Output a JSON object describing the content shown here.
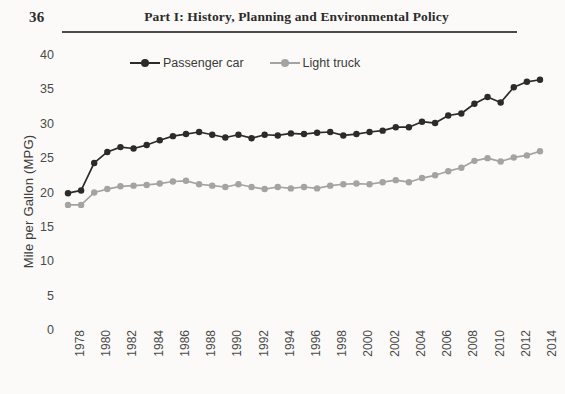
{
  "page": {
    "number": "36",
    "running_head": "Part I: History, Planning and Environmental Policy"
  },
  "chart_data": {
    "type": "line",
    "title": "",
    "xlabel": "",
    "ylabel": "Mile per Gallon (MPG)",
    "ylim": [
      0,
      40
    ],
    "yticks": [
      0,
      5,
      10,
      15,
      20,
      25,
      30,
      35,
      40
    ],
    "xlim": [
      1978,
      2014
    ],
    "xticks": [
      1978,
      1980,
      1982,
      1984,
      1986,
      1988,
      1990,
      1992,
      1994,
      1996,
      1998,
      2000,
      2002,
      2004,
      2006,
      2008,
      2010,
      2012,
      2014
    ],
    "xtick_labels": [
      "1978",
      "1980",
      "1982",
      "1984",
      "1986",
      "1988",
      "1990",
      "1992",
      "1994",
      "1996",
      "1998",
      "2000",
      "2002",
      "2004",
      "2006",
      "2008",
      "2010",
      "2012",
      "2014"
    ],
    "x": [
      1978,
      1979,
      1980,
      1981,
      1982,
      1983,
      1984,
      1985,
      1986,
      1987,
      1988,
      1989,
      1990,
      1991,
      1992,
      1993,
      1994,
      1995,
      1996,
      1997,
      1998,
      1999,
      2000,
      2001,
      2002,
      2003,
      2004,
      2005,
      2006,
      2007,
      2008,
      2009,
      2010,
      2011,
      2012,
      2013,
      2014
    ],
    "grid": false,
    "legend_position": "top-center",
    "marker": "circle",
    "series": [
      {
        "name": "Passenger car",
        "color": "#2b2b2b",
        "values": [
          19.9,
          20.3,
          24.3,
          25.9,
          26.6,
          26.4,
          26.9,
          27.6,
          28.2,
          28.5,
          28.8,
          28.4,
          28.0,
          28.4,
          27.9,
          28.4,
          28.3,
          28.6,
          28.5,
          28.7,
          28.8,
          28.3,
          28.5,
          28.8,
          29.0,
          29.5,
          29.5,
          30.3,
          30.1,
          31.2,
          31.5,
          32.9,
          33.9,
          33.1,
          35.3,
          36.1,
          36.4
        ]
      },
      {
        "name": "Light truck",
        "color": "#a3a3a3",
        "values": [
          18.2,
          18.2,
          20.0,
          20.5,
          20.9,
          21.0,
          21.1,
          21.3,
          21.6,
          21.7,
          21.2,
          21.0,
          20.8,
          21.2,
          20.8,
          20.5,
          20.8,
          20.6,
          20.8,
          20.6,
          21.0,
          21.2,
          21.3,
          21.2,
          21.5,
          21.8,
          21.5,
          22.1,
          22.5,
          23.1,
          23.6,
          24.6,
          25.0,
          24.5,
          25.1,
          25.4,
          26.0
        ]
      }
    ]
  }
}
